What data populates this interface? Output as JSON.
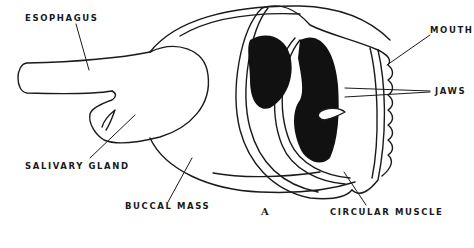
{
  "figure": {
    "letter": "A",
    "labels": {
      "esophagus": "ESOPHAGUS",
      "mouth": "MOUTH",
      "jaws": "JAWS",
      "salivary_gland": "SALIVARY GLAND",
      "buccal_mass": "BUCCAL MASS",
      "circular_muscle": "CIRCULAR MUSCLE"
    }
  },
  "colors": {
    "ink": "#1a1a1a",
    "background": "#ffffff"
  }
}
